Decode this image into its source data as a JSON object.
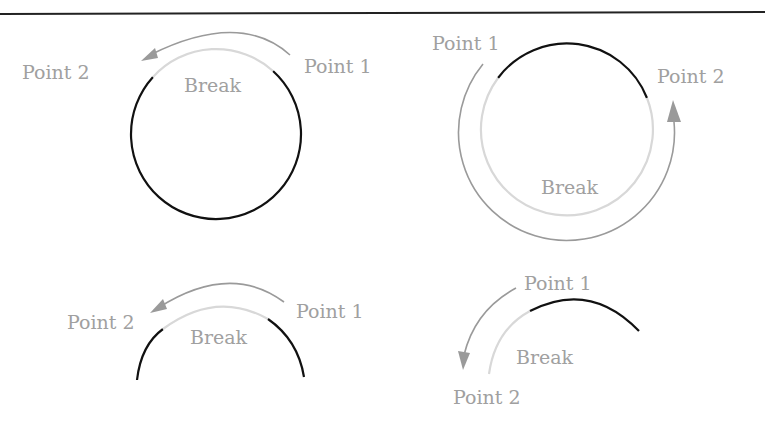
{
  "diagram": {
    "colors": {
      "solid_line": "#111111",
      "break_segment": "#d8d8d8",
      "arrow": "#9a9a9a",
      "label": "#a0a0a0",
      "top_rule": "#222222"
    },
    "panels": [
      {
        "id": "top-left",
        "shape": "circle",
        "labels": {
          "point1": "Point 1",
          "point2": "Point 2",
          "break": "Break"
        }
      },
      {
        "id": "top-right",
        "shape": "circle",
        "labels": {
          "point1": "Point 1",
          "point2": "Point 2",
          "break": "Break"
        }
      },
      {
        "id": "bottom-left",
        "shape": "arc",
        "labels": {
          "point1": "Point 1",
          "point2": "Point 2",
          "break": "Break"
        }
      },
      {
        "id": "bottom-right",
        "shape": "arc",
        "labels": {
          "point1": "Point 1",
          "point2": "Point 2",
          "break": "Break"
        }
      }
    ]
  }
}
